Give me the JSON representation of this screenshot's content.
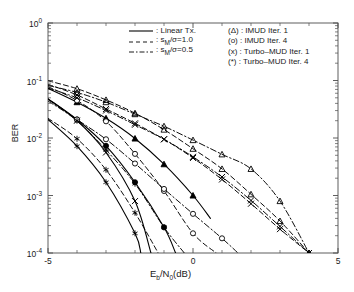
{
  "chart_data": {
    "type": "line",
    "title": "",
    "xlabel": "E_b/N_0(dB)",
    "ylabel": "BER",
    "xlim": [
      -5,
      5
    ],
    "ylim": [
      0.0001,
      1
    ],
    "yscale": "log",
    "grid": false,
    "xticks": [
      -5,
      0,
      5
    ],
    "xticklabels": [
      "-5",
      "0",
      "5"
    ],
    "yticks": [
      1,
      0.1,
      0.01,
      0.001,
      0.0001
    ],
    "yticklabels": [
      "10^0",
      "10^-1",
      "10^-2",
      "10^-3",
      "10^-4"
    ],
    "legend_position": "upper right",
    "series": [
      {
        "name": "Linear Tx., IMUD Iter. 1",
        "linestyle": "solid",
        "marker": "triangle",
        "x": [
          -5,
          -4,
          -3,
          -2,
          -1,
          0,
          0.6
        ],
        "y": [
          0.073,
          0.042,
          0.022,
          0.0098,
          0.0035,
          0.001,
          0.0004
        ]
      },
      {
        "name": "Linear Tx., IMUD Iter. 4",
        "linestyle": "solid",
        "marker": "circle",
        "x": [
          -5,
          -4,
          -3,
          -2,
          -1,
          -0.6
        ],
        "y": [
          0.048,
          0.021,
          0.0073,
          0.0017,
          0.00028,
          0.0001
        ]
      },
      {
        "name": "Linear Tx., Turbo-MUD Iter. 1",
        "linestyle": "solid",
        "marker": "x",
        "x": [
          -5,
          -4,
          -3,
          -2,
          -1.45
        ],
        "y": [
          0.048,
          0.02,
          0.0056,
          0.0008,
          0.0001
        ]
      },
      {
        "name": "Linear Tx., Turbo-MUD Iter. 4",
        "linestyle": "solid",
        "marker": "star",
        "x": [
          -5,
          -4,
          -3,
          -2,
          -1.8
        ],
        "y": [
          0.021,
          0.0072,
          0.0017,
          0.00022,
          0.0001
        ]
      },
      {
        "name": "s_M/sigma=1.0, IMUD Iter. 1",
        "linestyle": "dashed",
        "marker": "triangle",
        "x": [
          -5,
          -4,
          -3,
          -2,
          -1,
          0,
          1,
          2,
          3,
          4
        ],
        "y": [
          0.099,
          0.072,
          0.046,
          0.027,
          0.014,
          0.0065,
          0.0029,
          0.00105,
          0.00036,
          0.0001
        ]
      },
      {
        "name": "s_M/sigma=1.0, IMUD Iter. 4",
        "linestyle": "dashed",
        "marker": "circle",
        "x": [
          -5,
          -4,
          -3,
          -2,
          -1,
          0,
          0.8
        ],
        "y": [
          0.078,
          0.045,
          0.0195,
          0.0053,
          0.0012,
          0.00022,
          0.0001
        ]
      },
      {
        "name": "s_M/sigma=1.0, Turbo-MUD Iter. 1",
        "linestyle": "dashed",
        "marker": "x",
        "x": [
          -5,
          -4,
          -3,
          -2,
          -1,
          0,
          1,
          2,
          3,
          4
        ],
        "y": [
          0.086,
          0.056,
          0.032,
          0.018,
          0.0095,
          0.0045,
          0.0019,
          0.00072,
          0.00026,
          0.0001
        ]
      },
      {
        "name": "s_M/sigma=1.0, Turbo-MUD Iter. 4",
        "linestyle": "dashed",
        "marker": "star",
        "x": [
          -5,
          -4,
          -3,
          -2,
          -1.2
        ],
        "y": [
          0.022,
          0.0097,
          0.0028,
          0.0005,
          0.0001
        ]
      },
      {
        "name": "s_M/sigma=0.5, IMUD Iter. 1",
        "linestyle": "dashdot",
        "marker": "triangle",
        "x": [
          -5,
          -4,
          -3,
          -2,
          -1,
          0,
          1,
          2,
          3,
          4
        ],
        "y": [
          0.082,
          0.062,
          0.042,
          0.026,
          0.016,
          0.0092,
          0.0052,
          0.0029,
          0.0008,
          0.0001
        ]
      },
      {
        "name": "s_M/sigma=0.5, IMUD Iter. 4",
        "linestyle": "dashdot",
        "marker": "circle",
        "x": [
          -5,
          -4,
          -3,
          -2,
          -1,
          0,
          1,
          1.55
        ],
        "y": [
          0.047,
          0.021,
          0.0095,
          0.0036,
          0.0013,
          0.00048,
          0.00018,
          0.0001
        ]
      },
      {
        "name": "s_M/sigma=0.5, Turbo-MUD Iter. 1",
        "linestyle": "dashdot",
        "marker": "x",
        "x": [
          -5,
          -4,
          -3,
          -2,
          -1,
          0,
          1,
          2,
          3,
          4
        ],
        "y": [
          0.074,
          0.05,
          0.03,
          0.017,
          0.0095,
          0.0047,
          0.0021,
          0.00082,
          0.00029,
          0.0001
        ]
      },
      {
        "name": "s_M/sigma=0.5, Turbo-MUD Iter. 4",
        "linestyle": "dashdot",
        "marker": "star",
        "x": [
          -5,
          -4,
          -3,
          -2,
          -1,
          -0.3
        ],
        "y": [
          0.044,
          0.02,
          0.0062,
          0.0016,
          0.00028,
          0.0001
        ]
      }
    ]
  },
  "axes": {
    "ylabel": "BER",
    "xlabel_parts": {
      "e": "E",
      "b": "b",
      "slash": "/N",
      "zero": "0",
      "unit": "(dB)"
    },
    "xticklabels": [
      "-5",
      "0",
      "5"
    ],
    "yticklabels": [
      {
        "base": "10",
        "exp": "0"
      },
      {
        "base": "10",
        "exp": "-1"
      },
      {
        "base": "10",
        "exp": "-2"
      },
      {
        "base": "10",
        "exp": "-3"
      },
      {
        "base": "10",
        "exp": "-4"
      }
    ]
  },
  "legend": {
    "linestyles": [
      {
        "style": "solid",
        "label": ": Linear Tx."
      },
      {
        "style": "dashed",
        "label_pre": ": s",
        "label_sub": "M",
        "label_post": "/σ=1.0"
      },
      {
        "style": "dashdot",
        "label_pre": ": s",
        "label_sub": "M",
        "label_post": "/σ=0.5"
      }
    ],
    "markers": [
      {
        "symbol": "(Δ)",
        "label": " : IMUD Iter. 1"
      },
      {
        "symbol": "(o)",
        "label": " : IMUD Iter. 4"
      },
      {
        "symbol": "(x)",
        "label": " : Turbo–MUD Iter. 1"
      },
      {
        "symbol": "(*)",
        "label": " : Turbo–MUD Iter. 4"
      }
    ]
  },
  "colors": {
    "line": "#000000",
    "axis": "#4d4d4d",
    "background": "#ffffff",
    "text": "#1a1a1a"
  }
}
